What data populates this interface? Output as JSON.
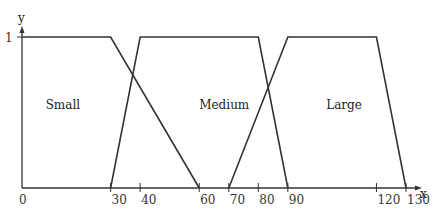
{
  "chart_data": {
    "type": "line",
    "title": "",
    "xlabel": "x",
    "ylabel": "y",
    "xlim": [
      0,
      130
    ],
    "ylim": [
      0,
      1
    ],
    "y_ticks": [
      "1"
    ],
    "x_ticks": [
      "0",
      "30",
      "40",
      "60",
      "70",
      "80",
      "90",
      "120",
      "130"
    ],
    "grid": false,
    "series": [
      {
        "name": "Small",
        "x": [
          0,
          30,
          60
        ],
        "y": [
          1,
          1,
          0
        ]
      },
      {
        "name": "Medium",
        "x": [
          30,
          40,
          80,
          90
        ],
        "y": [
          0,
          1,
          1,
          0
        ]
      },
      {
        "name": "Large",
        "x": [
          70,
          90,
          120,
          130
        ],
        "y": [
          0,
          1,
          1,
          0
        ]
      }
    ],
    "annotations": [
      {
        "text": "Small",
        "x": 8,
        "y": 0.55
      },
      {
        "text": "Medium",
        "x": 60,
        "y": 0.55
      },
      {
        "text": "Large",
        "x": 103,
        "y": 0.55
      }
    ]
  },
  "axes": {
    "x_label": "x",
    "y_label": "y",
    "y_tick_1": "1"
  }
}
